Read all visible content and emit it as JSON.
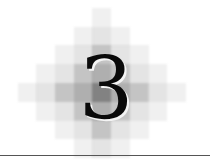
{
  "chapter": {
    "number": "3"
  },
  "colors": {
    "numeral": "#0a0a0a",
    "rule": "#555555",
    "cell_base": "#808080"
  }
}
